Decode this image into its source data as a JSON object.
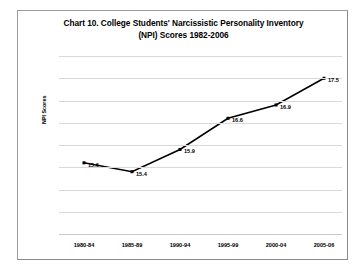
{
  "chart_data": {
    "type": "line",
    "title": "Chart 10. College Students' Narcissistic Personality Inventory (NPI) Scores 1982-2006",
    "title_line1": "Chart 10. College Students' Narcissistic Personality Inventory",
    "title_line2": "(NPI) Scores 1982-2006",
    "categories": [
      "1980-84",
      "1985-89",
      "1990-94",
      "1995-99",
      "2000-04",
      "2005-06"
    ],
    "values": [
      15.6,
      15.4,
      15.9,
      16.6,
      16.9,
      17.5
    ],
    "point_labels": [
      "15.6",
      "15.4",
      "15.9",
      "16.6",
      "16.9",
      "17.5"
    ],
    "xlabel": "",
    "ylabel": "NPI Scores",
    "ylim": [
      14,
      18
    ],
    "ytick_labels": [
      "18",
      "17.5",
      "17",
      "16.5",
      "16",
      "15.5",
      "15",
      "14.5",
      "14"
    ],
    "ytick_values": [
      18,
      17.5,
      17,
      16.5,
      16,
      15.5,
      15,
      14.5,
      14
    ],
    "grid": true,
    "legend": "none",
    "series_color": "#000000",
    "grid_color": "#d9d9d9",
    "marker": "square"
  }
}
